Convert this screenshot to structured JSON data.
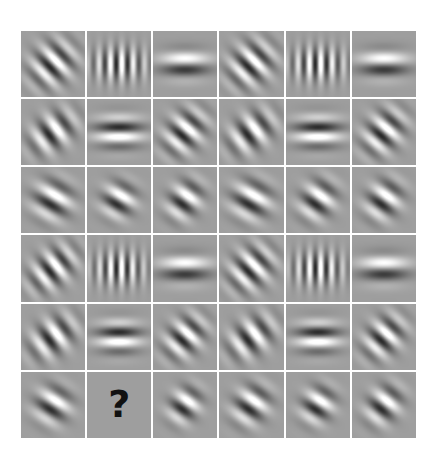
{
  "figure": {
    "kind": "matrix-puzzle",
    "rows": 6,
    "cols": 6,
    "background_color": "#9e9e9e",
    "separator_color": "#ffffff",
    "page_background": "#ffffff",
    "missing_marker": "?",
    "missing_cell": {
      "row": 6,
      "col": 2
    }
  },
  "chart_data": {
    "type": "heatmap",
    "xlabel": "",
    "ylabel": "",
    "grid": true,
    "legend": "none",
    "rows": 6,
    "cols": 6,
    "categories": [
      "col-1",
      "col-2",
      "col-3",
      "col-4",
      "col-5",
      "col-6"
    ],
    "row_labels": [
      "row-1",
      "row-2",
      "row-3",
      "row-4",
      "row-5",
      "row-6"
    ],
    "cells": [
      [
        {
          "label": "r1c1",
          "type": "gabor",
          "orientation": 45,
          "cycles": 3.6,
          "sigma_x": 0.2,
          "sigma_y": 0.26,
          "phase": 90,
          "contrast": 0.95
        },
        {
          "label": "r1c2",
          "type": "gabor",
          "orientation": 90,
          "cycles": 5.6,
          "sigma_x": 0.17,
          "sigma_y": 0.3,
          "phase": 90,
          "contrast": 0.95
        },
        {
          "label": "r1c3",
          "type": "gabor",
          "orientation": 0,
          "cycles": 2.4,
          "sigma_x": 0.26,
          "sigma_y": 0.15,
          "phase": 90,
          "contrast": 0.95
        },
        {
          "label": "r1c4",
          "type": "gabor",
          "orientation": 45,
          "cycles": 3.6,
          "sigma_x": 0.2,
          "sigma_y": 0.26,
          "phase": 90,
          "contrast": 0.95
        },
        {
          "label": "r1c5",
          "type": "gabor",
          "orientation": 90,
          "cycles": 5.6,
          "sigma_x": 0.17,
          "sigma_y": 0.3,
          "phase": 90,
          "contrast": 0.95
        },
        {
          "label": "r1c6",
          "type": "gabor",
          "orientation": 0,
          "cycles": 2.4,
          "sigma_x": 0.26,
          "sigma_y": 0.15,
          "phase": 90,
          "contrast": 0.95
        }
      ],
      [
        {
          "label": "r2c1",
          "type": "gabor",
          "orientation": 52,
          "cycles": 3.2,
          "sigma_x": 0.17,
          "sigma_y": 0.27,
          "phase": 90,
          "contrast": 0.95
        },
        {
          "label": "r2c2",
          "type": "gabor",
          "orientation": 0,
          "cycles": 3.1,
          "sigma_x": 0.25,
          "sigma_y": 0.17,
          "phase": 270,
          "contrast": 1.0
        },
        {
          "label": "r2c3",
          "type": "gabor",
          "orientation": 40,
          "cycles": 3.4,
          "sigma_x": 0.18,
          "sigma_y": 0.26,
          "phase": 90,
          "contrast": 0.95
        },
        {
          "label": "r2c4",
          "type": "gabor",
          "orientation": 52,
          "cycles": 3.2,
          "sigma_x": 0.17,
          "sigma_y": 0.27,
          "phase": 90,
          "contrast": 0.95
        },
        {
          "label": "r2c5",
          "type": "gabor",
          "orientation": 0,
          "cycles": 3.1,
          "sigma_x": 0.25,
          "sigma_y": 0.17,
          "phase": 270,
          "contrast": 1.0
        },
        {
          "label": "r2c6",
          "type": "gabor",
          "orientation": 40,
          "cycles": 3.4,
          "sigma_x": 0.18,
          "sigma_y": 0.26,
          "phase": 90,
          "contrast": 0.95
        }
      ],
      [
        {
          "label": "r3c1",
          "type": "gabor",
          "orientation": 30,
          "cycles": 2.9,
          "sigma_x": 0.2,
          "sigma_y": 0.21,
          "phase": 90,
          "contrast": 0.95
        },
        {
          "label": "r3c2",
          "type": "gabor",
          "orientation": 30,
          "cycles": 3.0,
          "sigma_x": 0.17,
          "sigma_y": 0.19,
          "phase": 90,
          "contrast": 0.95
        },
        {
          "label": "r3c3",
          "type": "gabor",
          "orientation": 35,
          "cycles": 3.0,
          "sigma_x": 0.16,
          "sigma_y": 0.22,
          "phase": 90,
          "contrast": 0.95
        },
        {
          "label": "r3c4",
          "type": "gabor",
          "orientation": 30,
          "cycles": 2.9,
          "sigma_x": 0.2,
          "sigma_y": 0.21,
          "phase": 90,
          "contrast": 0.95
        },
        {
          "label": "r3c5",
          "type": "gabor",
          "orientation": 35,
          "cycles": 3.0,
          "sigma_x": 0.17,
          "sigma_y": 0.22,
          "phase": 90,
          "contrast": 0.95
        },
        {
          "label": "r3c6",
          "type": "gabor",
          "orientation": 35,
          "cycles": 3.0,
          "sigma_x": 0.17,
          "sigma_y": 0.22,
          "phase": 90,
          "contrast": 0.95
        }
      ],
      [
        {
          "label": "r4c1",
          "type": "gabor",
          "orientation": 50,
          "cycles": 3.6,
          "sigma_x": 0.17,
          "sigma_y": 0.28,
          "phase": 90,
          "contrast": 0.95
        },
        {
          "label": "r4c2",
          "type": "gabor",
          "orientation": 90,
          "cycles": 5.8,
          "sigma_x": 0.17,
          "sigma_y": 0.28,
          "phase": 90,
          "contrast": 0.95
        },
        {
          "label": "r4c3",
          "type": "gabor",
          "orientation": 0,
          "cycles": 2.4,
          "sigma_x": 0.26,
          "sigma_y": 0.15,
          "phase": 90,
          "contrast": 0.95
        },
        {
          "label": "r4c4",
          "type": "gabor",
          "orientation": 45,
          "cycles": 3.6,
          "sigma_x": 0.19,
          "sigma_y": 0.26,
          "phase": 90,
          "contrast": 0.95
        },
        {
          "label": "r4c5",
          "type": "gabor",
          "orientation": 90,
          "cycles": 5.8,
          "sigma_x": 0.17,
          "sigma_y": 0.28,
          "phase": 90,
          "contrast": 0.95
        },
        {
          "label": "r4c6",
          "type": "gabor",
          "orientation": 0,
          "cycles": 2.4,
          "sigma_x": 0.26,
          "sigma_y": 0.15,
          "phase": 90,
          "contrast": 0.95
        }
      ],
      [
        {
          "label": "r5c1",
          "type": "gabor",
          "orientation": 52,
          "cycles": 3.2,
          "sigma_x": 0.17,
          "sigma_y": 0.27,
          "phase": 90,
          "contrast": 0.95
        },
        {
          "label": "r5c2",
          "type": "gabor",
          "orientation": 0,
          "cycles": 3.1,
          "sigma_x": 0.23,
          "sigma_y": 0.17,
          "phase": 270,
          "contrast": 1.0
        },
        {
          "label": "r5c3",
          "type": "gabor",
          "orientation": 42,
          "cycles": 3.4,
          "sigma_x": 0.17,
          "sigma_y": 0.25,
          "phase": 90,
          "contrast": 0.95
        },
        {
          "label": "r5c4",
          "type": "gabor",
          "orientation": 52,
          "cycles": 3.2,
          "sigma_x": 0.17,
          "sigma_y": 0.27,
          "phase": 90,
          "contrast": 0.95
        },
        {
          "label": "r5c5",
          "type": "gabor",
          "orientation": 0,
          "cycles": 3.1,
          "sigma_x": 0.23,
          "sigma_y": 0.17,
          "phase": 270,
          "contrast": 1.0
        },
        {
          "label": "r5c6",
          "type": "gabor",
          "orientation": 42,
          "cycles": 3.4,
          "sigma_x": 0.17,
          "sigma_y": 0.25,
          "phase": 90,
          "contrast": 0.95
        }
      ],
      [
        {
          "label": "r6c1",
          "type": "gabor",
          "orientation": 32,
          "cycles": 2.9,
          "sigma_x": 0.18,
          "sigma_y": 0.2,
          "phase": 90,
          "contrast": 0.95
        },
        {
          "label": "r6c2",
          "type": "missing",
          "marker": "?"
        },
        {
          "label": "r6c3",
          "type": "gabor",
          "orientation": 35,
          "cycles": 3.0,
          "sigma_x": 0.15,
          "sigma_y": 0.2,
          "phase": 90,
          "contrast": 0.95
        },
        {
          "label": "r6c4",
          "type": "gabor",
          "orientation": 35,
          "cycles": 3.0,
          "sigma_x": 0.17,
          "sigma_y": 0.22,
          "phase": 90,
          "contrast": 0.95
        },
        {
          "label": "r6c5",
          "type": "gabor",
          "orientation": 32,
          "cycles": 3.0,
          "sigma_x": 0.16,
          "sigma_y": 0.2,
          "phase": 90,
          "contrast": 0.95
        },
        {
          "label": "r6c6",
          "type": "gabor",
          "orientation": 38,
          "cycles": 3.0,
          "sigma_x": 0.16,
          "sigma_y": 0.22,
          "phase": 90,
          "contrast": 0.95
        }
      ]
    ]
  }
}
